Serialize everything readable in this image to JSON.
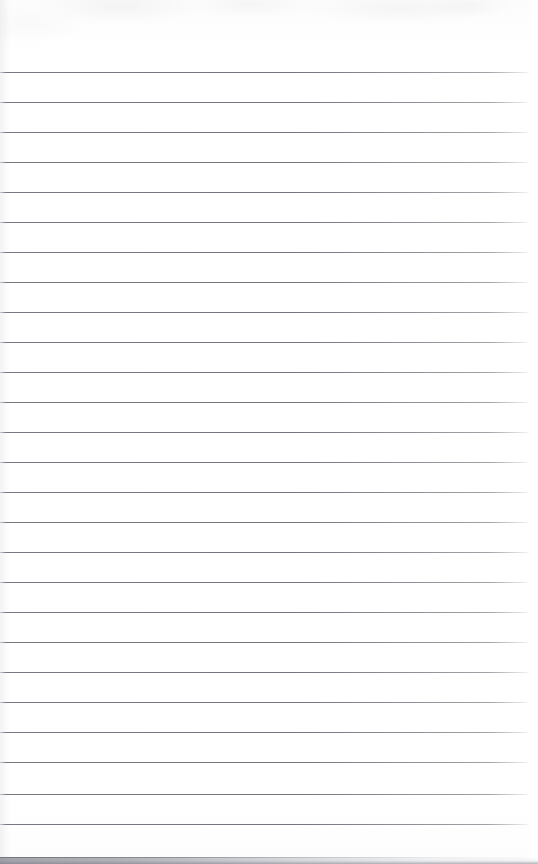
{
  "document": {
    "type": "lined-notebook-paper",
    "title": "Blank Ruled Notebook Page",
    "orientation": "portrait",
    "page_width": 538,
    "page_height": 864,
    "background_color": "#ffffff",
    "content_text": "",
    "is_blank": true
  },
  "ruling": {
    "style": "horizontal-ruled",
    "line_color": "#6c6e78",
    "line_thickness_px": 1,
    "line_spacing_px": 30,
    "first_line_y": 72,
    "last_line_y": 824,
    "line_count": 26,
    "left_margin_px": 0,
    "right_end_px": 530,
    "has_vertical_margin_rule": false,
    "line_positions": [
      72,
      102,
      132,
      162,
      192,
      222,
      252,
      282,
      312,
      342,
      372,
      402,
      432,
      462,
      492,
      522,
      552,
      582,
      612,
      642,
      672,
      702,
      732,
      762,
      794,
      824
    ]
  },
  "scan_artifacts": {
    "top_noise_band_height_px": 70,
    "bottom_edge_shadow_height_px": 7,
    "bottom_edge_shadow_color": "#78798400",
    "edge_shadow_strongest_side": "left",
    "paper_tone": "#fcfcfd"
  },
  "header": {
    "title_line_present": false,
    "header_text": ""
  }
}
